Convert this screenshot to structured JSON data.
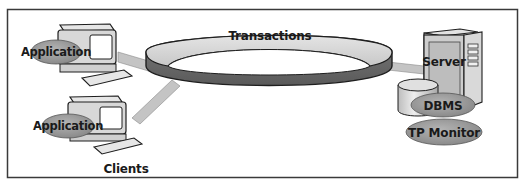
{
  "diagram": {
    "ring_label": "Transactions",
    "clients": {
      "group_label": "Clients",
      "items": [
        {
          "label": "Application"
        },
        {
          "label": "Application"
        }
      ]
    },
    "server": {
      "label": "Server",
      "components": [
        {
          "label": "DBMS"
        },
        {
          "label": "TP Monitor"
        }
      ]
    },
    "colors": {
      "frame": "#3a3a3a",
      "ring_top": "#d6d6d6",
      "ring_side": "#6e6e6e",
      "connector": "#c4c4c4",
      "ellipse_label": "#9a9a9a",
      "device_body": "#dcdcdc",
      "outline": "#1e1e1e"
    }
  }
}
